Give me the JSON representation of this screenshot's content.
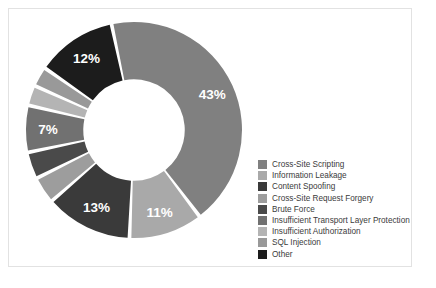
{
  "chart_data": {
    "type": "pie",
    "variant": "donut",
    "title": "",
    "subtitle": "",
    "xlabel": "",
    "ylabel": "",
    "legend_position": "right",
    "grid": false,
    "hole_ratio": 0.47,
    "start_angle_deg": -12,
    "categories": [
      "Cross-Site Scripting",
      "Information Leakage",
      "Content Spoofing",
      "Cross-Site Request Forgery",
      "Brute Force",
      "Insufficient Transport Layer Protection",
      "Insufficient Authorization",
      "SQL Injection",
      "Other"
    ],
    "values": [
      43,
      11,
      13,
      4,
      4,
      7,
      3,
      3,
      12
    ],
    "labels_shown": [
      "43%",
      "11%",
      "13%",
      "",
      "",
      "7%",
      "",
      "",
      "12%"
    ],
    "colors": [
      "#808080",
      "#a9a9a9",
      "#3a3a3a",
      "#9d9d9d",
      "#4a4a4a",
      "#717171",
      "#b4b4b4",
      "#999999",
      "#1c1c1c"
    ]
  },
  "legend": {
    "items": [
      {
        "label": "Cross-Site Scripting",
        "color": "#808080"
      },
      {
        "label": "Information Leakage",
        "color": "#a9a9a9"
      },
      {
        "label": "Content Spoofing",
        "color": "#3a3a3a"
      },
      {
        "label": "Cross-Site Request Forgery",
        "color": "#9d9d9d"
      },
      {
        "label": "Brute Force",
        "color": "#4a4a4a"
      },
      {
        "label": "Insufficient Transport Layer Protection",
        "color": "#717171"
      },
      {
        "label": "Insufficient Authorization",
        "color": "#b4b4b4"
      },
      {
        "label": "SQL Injection",
        "color": "#999999"
      },
      {
        "label": "Other",
        "color": "#1c1c1c"
      }
    ]
  },
  "style": {
    "background": "#ffffff",
    "frame_border": "#e2e2e2",
    "slice_gap_color": "#ffffff",
    "label_text_color": "#ffffff"
  }
}
